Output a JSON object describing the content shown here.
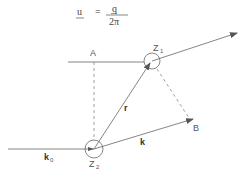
{
  "formula": {
    "lhs": "u",
    "equals": "=",
    "numerator": "q",
    "denominator": "2π"
  },
  "labels": {
    "A": "A",
    "B": "B",
    "Z1_main": "Z",
    "Z1_sub": "1",
    "Z2_main": "Z",
    "Z2_sub": "2",
    "r": "r",
    "k": "k",
    "k0_main": "k",
    "k0_sub": "0"
  },
  "colors": {
    "line": "#666666",
    "dashed": "#888888",
    "background": "#ffffff"
  }
}
